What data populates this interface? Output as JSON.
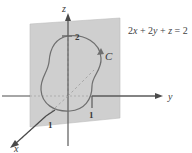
{
  "figure": {
    "equation": {
      "full": "2x + 2y + z = 2",
      "parts": [
        "2",
        "x",
        " + 2",
        "y",
        " + ",
        "z",
        " = 2"
      ]
    },
    "axes": [
      {
        "name": "z-axis",
        "label": "z",
        "direction": "up"
      },
      {
        "name": "y-axis",
        "label": "y",
        "direction": "right"
      },
      {
        "name": "x-axis",
        "label": "x",
        "direction": "down-left"
      }
    ],
    "ticks": [
      {
        "axis": "z",
        "label": "2",
        "value": 2
      },
      {
        "axis": "y",
        "label": "1",
        "value": 1
      },
      {
        "axis": "x",
        "label": "1",
        "value": 1
      }
    ],
    "curve": {
      "label": "C",
      "orientation": "counterclockwise-from-above",
      "description": "closed gourd-shaped curve lying in the plane"
    },
    "colors": {
      "plane_fill": "#cfcfcf",
      "plane_edge": "#b8b8b8",
      "axis_line": "#5a5a5a",
      "curve_stroke": "#6b6b6b",
      "dashed_line": "#9a9a9a",
      "text": "#3a3a3a",
      "background": "#ffffff"
    }
  }
}
